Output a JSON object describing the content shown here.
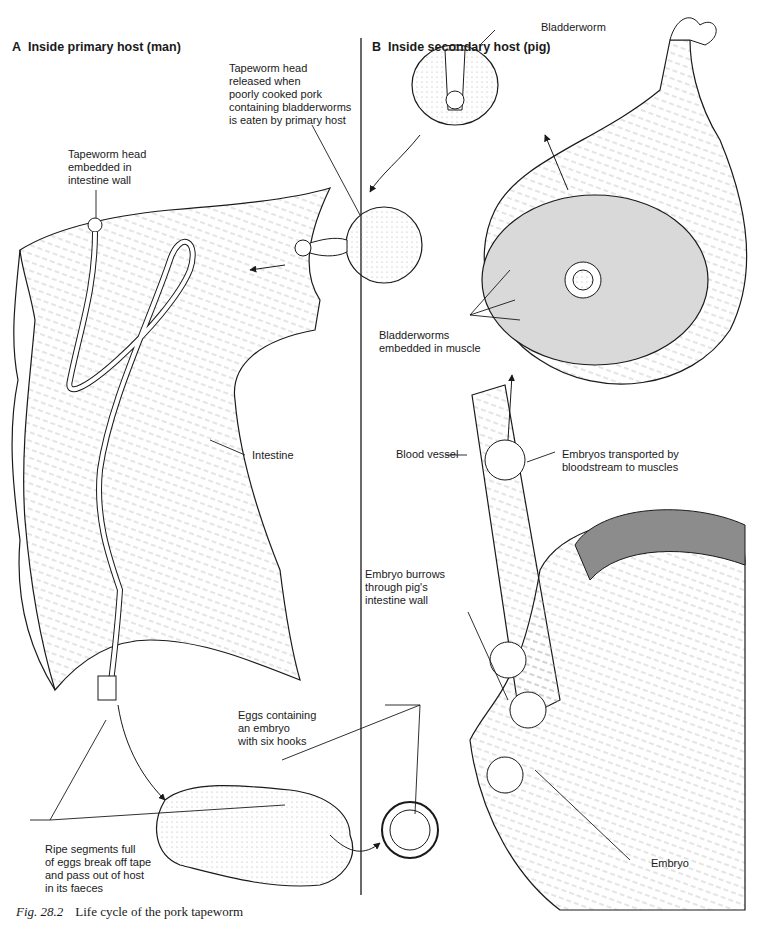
{
  "panels": {
    "a": {
      "letter": "A",
      "title": "Inside primary host (man)"
    },
    "b": {
      "letter": "B",
      "title": "Inside secondary host (pig)"
    }
  },
  "labels": {
    "tapeworm_head_released": "Tapeworm head\nreleased when\npoorly cooked pork\ncontaining bladderworms\nis eaten by primary host",
    "tapeworm_head_embedded": "Tapeworm head\nembedded in\nintestine wall",
    "intestine": "Intestine",
    "bladderworm": "Bladderworm",
    "bladderworms_in_muscle": "Bladderworms\nembedded in muscle",
    "blood_vessel": "Blood vessel",
    "embryos_transported": "Embryos transported by\nbloodstream to muscles",
    "embryo_burrows": "Embryo burrows\nthrough pig's\nintestine wall",
    "eggs_containing": "Eggs containing\nan embryo\nwith six hooks",
    "ripe_segments": "Ripe segments full\nof eggs break off tape\nand pass out of host\nin its faeces",
    "embryo": "Embryo"
  },
  "caption": {
    "fig_number": "Fig. 28.2",
    "text": "Life cycle of the pork tapeworm"
  },
  "colors": {
    "ink": "#1a1a1a",
    "tissue_fill": "#f2f2f2",
    "muscle_fill": "#d9d9d9",
    "band_fill": "#8c8c8c"
  }
}
